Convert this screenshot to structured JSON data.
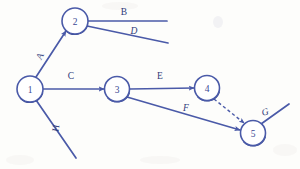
{
  "diagram": {
    "colors": {
      "stroke": "#4a5aa8",
      "stroke_dark": "#3d4c96",
      "label": "#2f3a7a",
      "node_fill": "#ffffff",
      "background": "#fdfdfb"
    },
    "nodes": [
      {
        "id": "1",
        "label": "1",
        "cx": 30,
        "cy": 89,
        "r": 13
      },
      {
        "id": "2",
        "label": "2",
        "cx": 75,
        "cy": 21,
        "r": 13
      },
      {
        "id": "3",
        "label": "3",
        "cx": 117,
        "cy": 89,
        "r": 12.5
      },
      {
        "id": "4",
        "label": "4",
        "cx": 207,
        "cy": 88,
        "r": 12.5
      },
      {
        "id": "5",
        "label": "5",
        "cx": 253,
        "cy": 133,
        "r": 12.5
      }
    ],
    "edges": [
      {
        "id": "A",
        "label": "A",
        "from": "1",
        "to": "2",
        "style": "solid",
        "arrow": true,
        "label_x": 40,
        "label_y": 56,
        "label_rotate": -62,
        "italic": false
      },
      {
        "id": "B",
        "label": "B",
        "from": "2",
        "to": "end",
        "style": "solid",
        "arrow": false,
        "label_x": 124,
        "label_y": 12,
        "label_rotate": 0,
        "italic": false
      },
      {
        "id": "D",
        "label": "D",
        "from": "2",
        "to": "end",
        "style": "solid",
        "arrow": false,
        "label_x": 134,
        "label_y": 31,
        "label_rotate": 0,
        "italic": true
      },
      {
        "id": "C",
        "label": "C",
        "from": "1",
        "to": "3",
        "style": "solid",
        "arrow": true,
        "label_x": 71,
        "label_y": 76,
        "label_rotate": 0,
        "italic": false
      },
      {
        "id": "E",
        "label": "E",
        "from": "3",
        "to": "4",
        "style": "solid",
        "arrow": true,
        "label_x": 160,
        "label_y": 76,
        "label_rotate": 0,
        "italic": false
      },
      {
        "id": "F",
        "label": "F",
        "from": "3",
        "to": "5",
        "style": "solid",
        "arrow": true,
        "label_x": 186,
        "label_y": 108,
        "label_rotate": 0,
        "italic": true
      },
      {
        "id": "G",
        "label": "G",
        "from": "5",
        "to": "end",
        "style": "solid",
        "arrow": false,
        "label_x": 265,
        "label_y": 112,
        "label_rotate": -18,
        "italic": true
      },
      {
        "id": "H",
        "label": "H",
        "from": "1",
        "to": "end",
        "style": "solid",
        "arrow": false,
        "label_x": 56,
        "label_y": 128,
        "label_rotate": -80,
        "italic": false
      },
      {
        "id": "dummy",
        "label": "",
        "from": "4",
        "to": "5",
        "style": "dashed",
        "arrow": true,
        "label_x": 0,
        "label_y": 0,
        "label_rotate": 0,
        "italic": false
      }
    ]
  }
}
